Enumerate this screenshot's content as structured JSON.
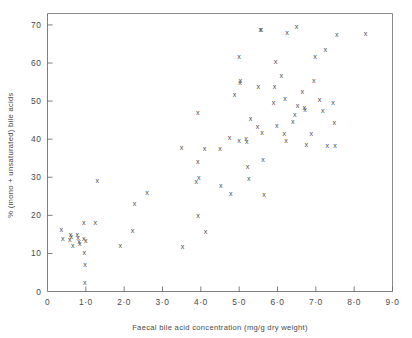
{
  "chart_data": {
    "type": "scatter",
    "title": "",
    "xlabel": "Faecal bile acid concentration (mg/g dry weight)",
    "ylabel": "% (mono + unsaturated) bile acids",
    "xlim": [
      0,
      9.0
    ],
    "ylim": [
      0,
      73
    ],
    "grid": false,
    "legend": null,
    "marker_symbol": "x",
    "xticks": [
      0,
      1.0,
      2.0,
      3.0,
      4.0,
      5.0,
      6.0,
      7.0,
      8.0,
      9.0
    ],
    "xtick_labels": [
      "0",
      "1·0",
      "2·0",
      "3·0",
      "4·0",
      "5·0",
      "6·0",
      "7·0",
      "8·0",
      "9·0"
    ],
    "yticks": [
      10,
      20,
      30,
      40,
      50,
      60,
      70
    ],
    "ytick_labels": [
      "10",
      "20",
      "30",
      "40",
      "50",
      "60",
      "70"
    ],
    "ytick_zero_label": "0",
    "points": [
      [
        0.36,
        16.3
      ],
      [
        0.4,
        14.0
      ],
      [
        0.6,
        14.9
      ],
      [
        0.62,
        14.4
      ],
      [
        0.58,
        13.6
      ],
      [
        0.66,
        12.0
      ],
      [
        0.78,
        14.9
      ],
      [
        0.8,
        14.2
      ],
      [
        0.82,
        13.2
      ],
      [
        0.84,
        12.6
      ],
      [
        0.95,
        18.2
      ],
      [
        0.95,
        13.9
      ],
      [
        1.0,
        13.3
      ],
      [
        0.96,
        10.2
      ],
      [
        0.98,
        7.0
      ],
      [
        0.97,
        2.3
      ],
      [
        1.25,
        18.2
      ],
      [
        1.3,
        29.1
      ],
      [
        1.9,
        12.2
      ],
      [
        2.22,
        16.1
      ],
      [
        2.27,
        23.0
      ],
      [
        2.6,
        25.9
      ],
      [
        3.5,
        37.7
      ],
      [
        3.52,
        11.9
      ],
      [
        3.88,
        28.9
      ],
      [
        3.95,
        29.9
      ],
      [
        3.92,
        34.1
      ],
      [
        3.92,
        46.9
      ],
      [
        3.93,
        20.0
      ],
      [
        4.1,
        37.6
      ],
      [
        4.12,
        15.7
      ],
      [
        4.5,
        37.6
      ],
      [
        4.52,
        27.9
      ],
      [
        4.75,
        40.5
      ],
      [
        4.78,
        25.7
      ],
      [
        4.88,
        51.8
      ],
      [
        5.0,
        39.7
      ],
      [
        5.02,
        54.8
      ],
      [
        5.03,
        55.4
      ],
      [
        5.0,
        61.6
      ],
      [
        5.18,
        40.3
      ],
      [
        5.2,
        39.5
      ],
      [
        5.22,
        32.7
      ],
      [
        5.25,
        29.8
      ],
      [
        5.3,
        45.3
      ],
      [
        5.48,
        43.4
      ],
      [
        5.5,
        53.8
      ],
      [
        5.55,
        68.7
      ],
      [
        5.58,
        68.7
      ],
      [
        5.6,
        41.8
      ],
      [
        5.62,
        34.6
      ],
      [
        5.65,
        25.6
      ],
      [
        5.9,
        49.6
      ],
      [
        5.92,
        53.8
      ],
      [
        5.95,
        60.4
      ],
      [
        5.98,
        43.6
      ],
      [
        6.1,
        56.8
      ],
      [
        6.18,
        41.5
      ],
      [
        6.2,
        50.8
      ],
      [
        6.22,
        39.6
      ],
      [
        6.25,
        67.9
      ],
      [
        6.4,
        44.7
      ],
      [
        6.45,
        46.5
      ],
      [
        6.5,
        69.6
      ],
      [
        6.52,
        48.8
      ],
      [
        6.65,
        52.6
      ],
      [
        6.7,
        48.3
      ],
      [
        6.72,
        47.9
      ],
      [
        6.75,
        38.5
      ],
      [
        6.88,
        41.5
      ],
      [
        6.95,
        55.4
      ],
      [
        6.98,
        61.6
      ],
      [
        7.1,
        50.5
      ],
      [
        7.18,
        47.5
      ],
      [
        7.25,
        63.5
      ],
      [
        7.3,
        38.4
      ],
      [
        7.45,
        49.5
      ],
      [
        7.48,
        44.3
      ],
      [
        7.5,
        38.4
      ],
      [
        7.55,
        67.6
      ],
      [
        8.3,
        67.7
      ]
    ]
  }
}
